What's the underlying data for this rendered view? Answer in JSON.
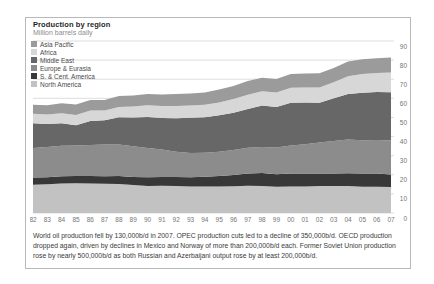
{
  "header": {
    "title": "Production by region",
    "subtitle": "Million barrels daily"
  },
  "chart_data": {
    "type": "area",
    "stacked": true,
    "title": "Production by region",
    "subtitle_unit": "Million barrels daily",
    "x": [
      1982,
      1983,
      1984,
      1985,
      1986,
      1987,
      1988,
      1989,
      1990,
      1991,
      1992,
      1993,
      1994,
      1995,
      1996,
      1997,
      1998,
      1999,
      2000,
      2001,
      2002,
      2003,
      2004,
      2005,
      2006,
      2007
    ],
    "x_tick_labels": [
      "82",
      "83",
      "84",
      "85",
      "86",
      "87",
      "88",
      "89",
      "90",
      "91",
      "92",
      "93",
      "94",
      "95",
      "96",
      "97",
      "98",
      "99",
      "00",
      "01",
      "02",
      "03",
      "04",
      "05",
      "06",
      "07"
    ],
    "y_ticks": [
      0,
      10,
      20,
      30,
      40,
      50,
      60,
      70,
      80,
      90
    ],
    "ylim": [
      0,
      90
    ],
    "grid": "horizontal",
    "legend_position": "top-left",
    "series_order_note": "series listed bottom-to-top of stack",
    "series": [
      {
        "name": "North America",
        "color": "#c2c2c2",
        "values": [
          14.8,
          15.0,
          15.4,
          15.6,
          15.4,
          15.3,
          15.2,
          14.6,
          14.2,
          14.3,
          14.1,
          13.9,
          13.9,
          13.8,
          14.0,
          14.3,
          14.2,
          13.7,
          13.9,
          13.9,
          14.1,
          14.2,
          14.1,
          13.7,
          13.7,
          13.6
        ]
      },
      {
        "name": "S. & Cent. America",
        "color": "#383838",
        "values": [
          3.7,
          3.7,
          3.8,
          3.8,
          3.9,
          3.9,
          4.1,
          4.2,
          4.5,
          4.6,
          4.7,
          4.8,
          5.1,
          5.5,
          5.9,
          6.3,
          6.8,
          6.6,
          6.8,
          6.7,
          6.6,
          6.4,
          6.7,
          6.9,
          6.9,
          6.6
        ]
      },
      {
        "name": "Europe & Eurasia",
        "color": "#8c8c8c",
        "values": [
          15.5,
          15.8,
          16.0,
          15.9,
          16.3,
          16.6,
          16.6,
          16.1,
          15.3,
          14.3,
          13.2,
          12.7,
          12.5,
          12.8,
          13.1,
          13.5,
          13.6,
          14.0,
          14.6,
          15.4,
          16.2,
          17.0,
          17.6,
          17.5,
          17.6,
          17.8
        ]
      },
      {
        "name": "Middle East",
        "color": "#676767",
        "values": [
          13.0,
          12.1,
          11.8,
          10.6,
          12.6,
          12.7,
          14.2,
          15.1,
          16.2,
          16.5,
          17.6,
          18.4,
          18.6,
          19.0,
          19.5,
          20.4,
          21.6,
          21.1,
          22.4,
          21.8,
          20.8,
          22.4,
          23.9,
          24.8,
          25.1,
          25.2
        ]
      },
      {
        "name": "Africa",
        "color": "#d7d7d7",
        "values": [
          4.9,
          4.9,
          5.2,
          5.4,
          5.4,
          5.1,
          5.4,
          5.8,
          6.2,
          6.3,
          6.4,
          6.4,
          6.5,
          6.8,
          7.1,
          7.4,
          7.5,
          7.6,
          7.8,
          7.9,
          8.0,
          8.4,
          9.3,
          9.9,
          10.0,
          10.3
        ]
      },
      {
        "name": "Asia Pacific",
        "color": "#9b9b9b",
        "values": [
          4.7,
          4.9,
          5.2,
          5.4,
          5.5,
          5.5,
          5.7,
          5.7,
          5.8,
          6.0,
          6.2,
          6.3,
          6.5,
          6.7,
          6.9,
          7.1,
          7.1,
          7.1,
          7.3,
          7.3,
          7.4,
          7.5,
          7.6,
          7.7,
          7.7,
          7.9
        ]
      }
    ]
  },
  "caption": {
    "text": "World oil production fell by 130,000b/d in 2007. OPEC production cuts led to a decline of 350,000b/d. OECD production dropped again, driven by declines in Mexico and Norway of more than 200,000b/d each. Former Soviet Union production rose by nearly 500,000b/d as both Russian and Azerbaijani output rose by at least 200,000b/d."
  },
  "style": {
    "grid_color": "#cfcfcf",
    "tick_label_color": "#757575",
    "frame_border_color": "#b9b9b9"
  }
}
